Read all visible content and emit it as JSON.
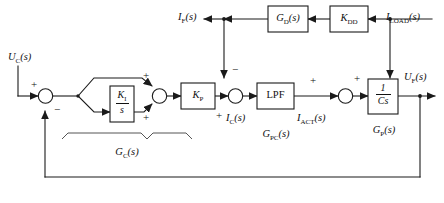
{
  "diagram": {
    "type": "block-diagram",
    "colors": {
      "line": "#1a1a1a",
      "background": "#ffffff",
      "text": "#111111"
    },
    "signals": {
      "input_uc": "U",
      "input_uc_sub": "C",
      "input_uc_arg": "(s)",
      "if": "I",
      "if_sub": "F",
      "if_arg": "(s)",
      "iload": "I",
      "iload_sub": "LOAD",
      "iload_arg": "(s)",
      "ic": "I",
      "ic_sub": "C",
      "ic_arg": "(s)",
      "iact": "I",
      "iact_sub": "ACT",
      "iact_arg": "(s)",
      "output_uf": "U",
      "output_uf_sub": "F",
      "output_uf_arg": "(s)"
    },
    "blocks": {
      "ki_num": "K",
      "ki_num_sub": "I",
      "ki_den": "s",
      "kp": "K",
      "kp_sub": "P",
      "lpf": "LPF",
      "gd": "G",
      "gd_sub": "D",
      "gd_arg": "(s)",
      "kdd": "K",
      "kdd_sub": "DD",
      "plant_num": "1",
      "plant_den": "Cs"
    },
    "annotations": {
      "gc": "G",
      "gc_sub": "C",
      "gc_arg": "(s)",
      "gpc": "G",
      "gpc_sub": "PC",
      "gpc_arg": "(s)",
      "gp": "G",
      "gp_sub": "P",
      "gp_arg": "(s)"
    },
    "signs": {
      "sum1_input": "+",
      "sum1_feedback": "−",
      "sum2_top": "+",
      "sum2_bottom": "+",
      "sum3_left": "+",
      "sum3_top": "−",
      "sum4_top": "+"
    }
  }
}
